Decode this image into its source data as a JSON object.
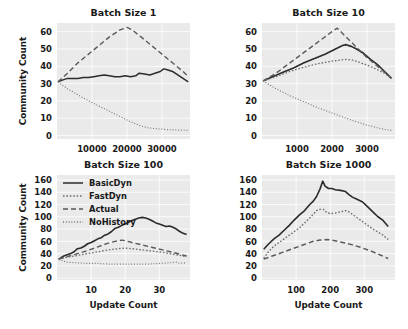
{
  "figure": {
    "width": 408,
    "height": 329,
    "background": "#ffffff",
    "plot_background": "#eaeaea",
    "grid_color": "#ffffff"
  },
  "legend": {
    "position": "upper-left of bottom-left panel",
    "entries": [
      {
        "label": "BasicDyn",
        "style": "solid",
        "color": "#2b2b2b"
      },
      {
        "label": "FastDyn",
        "style": "dotted",
        "color": "#6e6e6e"
      },
      {
        "label": "Actual",
        "style": "dashed",
        "color": "#5a5a5a"
      },
      {
        "label": "NoHistory",
        "style": "fine-dotted",
        "color": "#7a7a7a"
      }
    ]
  },
  "chart_data": [
    {
      "id": "batch-size-1",
      "type": "line",
      "title": "Batch Size 1",
      "xlabel": "",
      "ylabel": "Community Count",
      "xlim": [
        0,
        38000
      ],
      "ylim": [
        -2,
        65
      ],
      "xticks": [
        10000,
        20000,
        30000
      ],
      "xticklabels": [
        "10000",
        "20000",
        "30000"
      ],
      "yticks": [
        0,
        10,
        20,
        30,
        40,
        50,
        60
      ],
      "yticklabels": [
        "0",
        "10",
        "20",
        "30",
        "40",
        "50",
        "60"
      ],
      "grid": true,
      "series": [
        {
          "name": "BasicDyn",
          "style": "solid",
          "color": "#2b2b2b",
          "width": 1.5,
          "x": [
            300,
            1500,
            3000,
            4500,
            6000,
            7500,
            9000,
            10500,
            12000,
            13500,
            15000,
            16500,
            18000,
            19500,
            21000,
            22500,
            23500,
            25000,
            26500,
            28000,
            29500,
            30500,
            31500,
            33000,
            34500,
            36000,
            37500
          ],
          "y": [
            31,
            32,
            33,
            33,
            33,
            33.5,
            33.5,
            34,
            34.5,
            35,
            34.5,
            34,
            34,
            34.5,
            34,
            34.5,
            36,
            35.5,
            35,
            36,
            37,
            38.5,
            38,
            37,
            35,
            33,
            31
          ]
        },
        {
          "name": "Actual",
          "style": "dashed",
          "color": "#5a5a5a",
          "width": 1.4,
          "x": [
            300,
            3000,
            6000,
            9000,
            12000,
            15000,
            18000,
            20000,
            21500,
            24000,
            27000,
            30000,
            33000,
            36000,
            37500
          ],
          "y": [
            31,
            36,
            42,
            47,
            52,
            57,
            61,
            62.5,
            61,
            57,
            52,
            47,
            42,
            37,
            34
          ]
        },
        {
          "name": "NoHistory",
          "style": "fine-dotted",
          "color": "#7a7a7a",
          "width": 1.2,
          "x": [
            300,
            3000,
            6000,
            9000,
            12000,
            15000,
            18000,
            21000,
            24000,
            26000,
            28000,
            31000,
            34000,
            37500
          ],
          "y": [
            31,
            27,
            23.5,
            20,
            17,
            14,
            11,
            8,
            5.5,
            4.5,
            4,
            3.5,
            3.2,
            3
          ]
        }
      ]
    },
    {
      "id": "batch-size-10",
      "type": "line",
      "title": "Batch Size 10",
      "xlabel": "",
      "ylabel": "",
      "xlim": [
        0,
        3800
      ],
      "ylim": [
        -2,
        65
      ],
      "xticks": [
        1000,
        2000,
        3000
      ],
      "xticklabels": [
        "1000",
        "2000",
        "3000"
      ],
      "yticks": [
        0,
        10,
        20,
        30,
        40,
        50,
        60
      ],
      "yticklabels": [
        "0",
        "10",
        "20",
        "30",
        "40",
        "50",
        "60"
      ],
      "grid": true,
      "series": [
        {
          "name": "BasicDyn",
          "style": "solid",
          "color": "#2b2b2b",
          "width": 1.6,
          "x": [
            30,
            300,
            600,
            900,
            1200,
            1500,
            1800,
            2100,
            2300,
            2400,
            2550,
            2700,
            2900,
            3100,
            3300,
            3500,
            3700
          ],
          "y": [
            31.5,
            34,
            36.5,
            39,
            42,
            44.5,
            47,
            50,
            52,
            52.5,
            51.5,
            50,
            47.5,
            44,
            41,
            37,
            33
          ]
        },
        {
          "name": "Actual",
          "style": "dashed",
          "color": "#5a5a5a",
          "width": 1.4,
          "x": [
            30,
            400,
            800,
            1200,
            1600,
            2000,
            2150,
            2400,
            2700,
            3000,
            3300,
            3700
          ],
          "y": [
            31.5,
            36,
            42,
            48,
            54,
            60,
            62,
            57,
            51,
            45,
            40,
            33
          ]
        },
        {
          "name": "FastDyn",
          "style": "dotted",
          "color": "#6e6e6e",
          "width": 1.3,
          "x": [
            30,
            400,
            800,
            1200,
            1600,
            2000,
            2400,
            2600,
            2900,
            3200,
            3500,
            3700
          ],
          "y": [
            31.5,
            34,
            37,
            39.5,
            41.5,
            43,
            44,
            43.5,
            41.5,
            39,
            36,
            33
          ]
        },
        {
          "name": "NoHistory",
          "style": "fine-dotted",
          "color": "#7a7a7a",
          "width": 1.2,
          "x": [
            30,
            400,
            800,
            1200,
            1600,
            2000,
            2400,
            2700,
            3000,
            3300,
            3500,
            3700
          ],
          "y": [
            31.5,
            27,
            23,
            19.5,
            16,
            13,
            10,
            8,
            6,
            4.5,
            3.5,
            3
          ]
        }
      ]
    },
    {
      "id": "batch-size-100",
      "type": "line",
      "title": "Batch Size 100",
      "xlabel": "Update Count",
      "ylabel": "Community Count",
      "xlim": [
        0,
        39
      ],
      "ylim": [
        -3,
        168
      ],
      "xticks": [
        10,
        20,
        30
      ],
      "xticklabels": [
        "10",
        "20",
        "30"
      ],
      "yticks": [
        0,
        20,
        40,
        60,
        80,
        100,
        120,
        140,
        160
      ],
      "yticklabels": [
        "0",
        "20",
        "40",
        "60",
        "80",
        "100",
        "120",
        "140",
        "160"
      ],
      "grid": true,
      "series": [
        {
          "name": "BasicDyn",
          "style": "solid",
          "color": "#2b2b2b",
          "width": 1.6,
          "x": [
            0.5,
            2,
            3,
            4,
            5,
            6,
            7,
            8,
            9,
            10,
            11,
            12,
            13,
            14,
            15,
            16,
            17,
            18,
            19,
            20,
            21,
            22,
            23,
            24,
            25,
            26,
            27,
            28,
            29,
            30,
            31,
            32,
            33,
            34,
            35,
            36,
            37,
            38
          ],
          "y": [
            31,
            36,
            38,
            40,
            43,
            48,
            49,
            52,
            56,
            58,
            61,
            64,
            66,
            70,
            72,
            76,
            81,
            83,
            86,
            88,
            91,
            94,
            96,
            98,
            99,
            98,
            96,
            93,
            90,
            88,
            86,
            84,
            85,
            83,
            80,
            76,
            73,
            71
          ]
        },
        {
          "name": "Actual",
          "style": "dashed",
          "color": "#5a5a5a",
          "width": 1.4,
          "x": [
            0.5,
            3,
            6,
            9,
            12,
            15,
            17,
            19,
            20,
            22,
            25,
            28,
            31,
            34,
            36,
            38
          ],
          "y": [
            31,
            35,
            40,
            45,
            51,
            57,
            60,
            62,
            61,
            58,
            54,
            50,
            46,
            42,
            39,
            36
          ]
        },
        {
          "name": "FastDyn",
          "style": "dotted",
          "color": "#6e6e6e",
          "width": 1.3,
          "x": [
            0.5,
            3,
            6,
            9,
            12,
            15,
            18,
            20,
            22,
            25,
            28,
            31,
            34,
            36,
            38
          ],
          "y": [
            31,
            34,
            37,
            40,
            43,
            46,
            48,
            49,
            48,
            46,
            44,
            42,
            39,
            37,
            35
          ]
        },
        {
          "name": "NoHistory",
          "style": "fine-dotted",
          "color": "#7a7a7a",
          "width": 1.2,
          "x": [
            0.5,
            3,
            6,
            9,
            12,
            15,
            18,
            21,
            24,
            27,
            30,
            33,
            35,
            36,
            37,
            38
          ],
          "y": [
            30,
            26,
            25,
            24,
            24,
            23,
            23,
            23,
            23,
            23,
            24,
            25,
            26,
            24,
            25,
            24
          ]
        }
      ]
    },
    {
      "id": "batch-size-1000",
      "type": "line",
      "title": "Batch Size 1000",
      "xlabel": "Update Count",
      "ylabel": "",
      "xlim": [
        0,
        390
      ],
      "ylim": [
        -3,
        168
      ],
      "xticks": [
        100,
        200,
        300
      ],
      "xticklabels": [
        "100",
        "200",
        "300"
      ],
      "yticks": [
        0,
        20,
        40,
        60,
        80,
        100,
        120,
        140,
        160
      ],
      "yticklabels": [
        "0",
        "20",
        "40",
        "60",
        "80",
        "100",
        "120",
        "140",
        "160"
      ],
      "grid": true,
      "series": [
        {
          "name": "BasicDyn",
          "style": "solid",
          "color": "#2b2b2b",
          "width": 1.6,
          "x": [
            5,
            20,
            35,
            50,
            65,
            80,
            95,
            110,
            125,
            140,
            150,
            160,
            170,
            178,
            185,
            195,
            205,
            215,
            230,
            245,
            255,
            265,
            280,
            295,
            310,
            325,
            340,
            355,
            370
          ],
          "y": [
            47,
            56,
            64,
            70,
            78,
            86,
            95,
            103,
            110,
            120,
            125,
            133,
            145,
            158,
            150,
            146,
            146,
            144,
            143,
            141,
            136,
            132,
            128,
            124,
            116,
            108,
            100,
            94,
            84
          ]
        },
        {
          "name": "FastDyn",
          "style": "dotted",
          "color": "#6e6e6e",
          "width": 1.4,
          "x": [
            5,
            20,
            35,
            50,
            65,
            80,
            95,
            110,
            125,
            140,
            150,
            160,
            170,
            180,
            190,
            200,
            215,
            230,
            245,
            255,
            265,
            280,
            295,
            310,
            325,
            340,
            355,
            370
          ],
          "y": [
            32,
            44,
            52,
            58,
            64,
            70,
            76,
            82,
            90,
            98,
            104,
            110,
            112,
            112,
            107,
            105,
            106,
            108,
            110,
            108,
            104,
            98,
            92,
            86,
            80,
            75,
            70,
            63
          ]
        },
        {
          "name": "Actual",
          "style": "dashed",
          "color": "#5a5a5a",
          "width": 1.5,
          "x": [
            5,
            30,
            60,
            90,
            120,
            150,
            170,
            190,
            205,
            230,
            260,
            290,
            320,
            350,
            370
          ],
          "y": [
            31,
            36,
            42,
            48,
            54,
            60,
            62,
            63,
            62,
            59,
            55,
            50,
            44,
            37,
            32
          ]
        }
      ]
    }
  ]
}
